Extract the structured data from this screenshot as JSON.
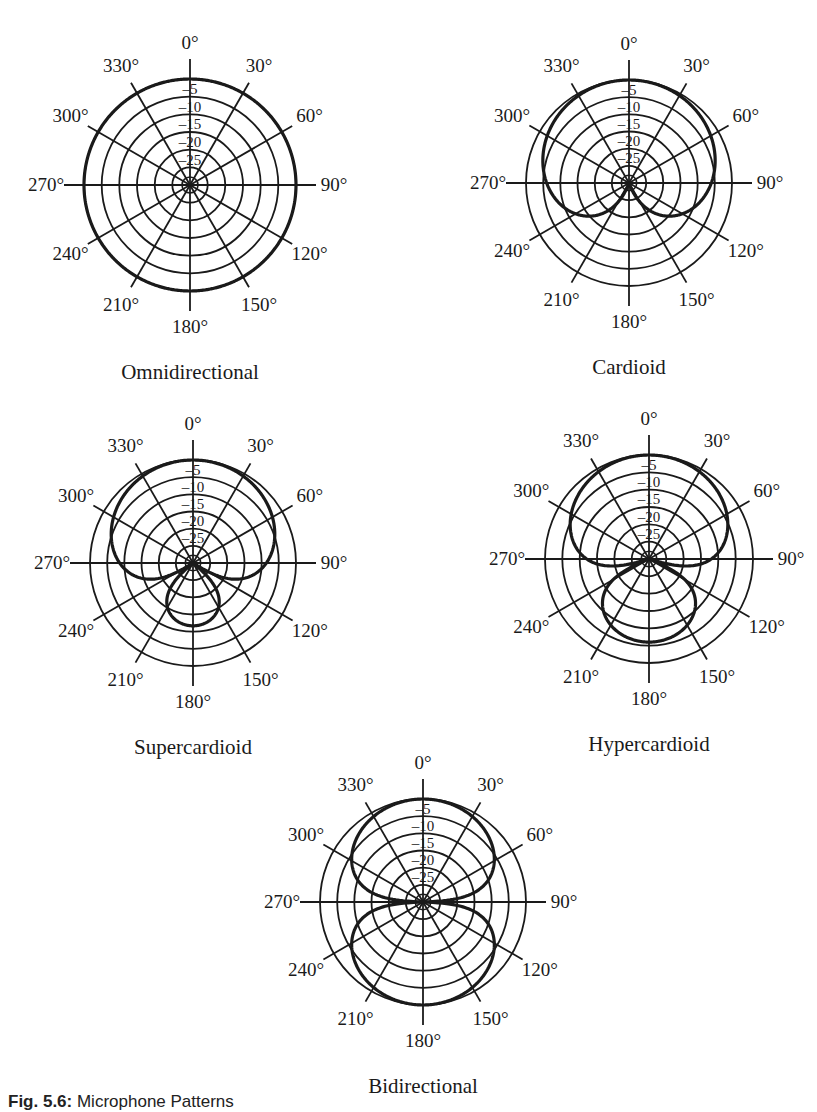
{
  "figure": {
    "caption_label": "Fig. 5.6:",
    "caption_text": " Microphone Patterns",
    "line_color": "#1a1a1a",
    "background": "#ffffff"
  },
  "chart_data": [
    {
      "type": "polar",
      "title": "Omnidirectional",
      "center": [
        190,
        185
      ],
      "radius": 106,
      "pattern_coefficient": 1.0,
      "theta_labels": [
        "0°",
        "30°",
        "60°",
        "90°",
        "120°",
        "150°",
        "180°",
        "210°",
        "240°",
        "270°",
        "300°",
        "330°"
      ],
      "ring_labels": [
        "–5",
        "–10",
        "–15",
        "–20",
        "–25"
      ],
      "r_range_db": [
        -30,
        0
      ],
      "angles_deg": [
        0,
        30,
        60,
        90,
        120,
        150,
        180,
        210,
        240,
        270,
        300,
        330
      ],
      "values_db": [
        0,
        0,
        0,
        0,
        0,
        0,
        0,
        0,
        0,
        0,
        0,
        0
      ]
    },
    {
      "type": "polar",
      "title": "Cardioid",
      "center": [
        629,
        183
      ],
      "radius": 103,
      "pattern_coefficient": 0.5,
      "theta_labels": [
        "0°",
        "30°",
        "60°",
        "90°",
        "120°",
        "150°",
        "180°",
        "210°",
        "240°",
        "270°",
        "300°",
        "330°"
      ],
      "ring_labels": [
        "–5",
        "–10",
        "–15",
        "–20",
        "–25"
      ],
      "r_range_db": [
        -30,
        0
      ],
      "angles_deg": [
        0,
        30,
        60,
        90,
        120,
        150,
        180,
        210,
        240,
        270,
        300,
        330
      ],
      "values_db": [
        0,
        -0.6,
        -2.5,
        -6,
        -12,
        -23,
        -30,
        -23,
        -12,
        -6,
        -2.5,
        -0.6
      ]
    },
    {
      "type": "polar",
      "title": "Supercardioid",
      "center": [
        193,
        563
      ],
      "radius": 103,
      "pattern_coefficient": 0.37,
      "theta_labels": [
        "0°",
        "30°",
        "60°",
        "90°",
        "120°",
        "150°",
        "180°",
        "210°",
        "240°",
        "270°",
        "300°",
        "330°"
      ],
      "ring_labels": [
        "–5",
        "–10",
        "–15",
        "–20",
        "–25"
      ],
      "r_range_db": [
        -30,
        0
      ],
      "angles_deg": [
        0,
        30,
        60,
        90,
        120,
        150,
        180,
        210,
        240,
        270,
        300,
        330
      ],
      "values_db": [
        0,
        -0.8,
        -3.6,
        -8.6,
        -30,
        -15,
        -11.7,
        -15,
        -30,
        -8.6,
        -3.6,
        -0.8
      ]
    },
    {
      "type": "polar",
      "title": "Hypercardioid",
      "center": [
        649,
        559
      ],
      "radius": 104,
      "pattern_coefficient": 0.25,
      "theta_labels": [
        "0°",
        "30°",
        "60°",
        "90°",
        "120°",
        "150°",
        "180°",
        "210°",
        "240°",
        "270°",
        "300°",
        "330°"
      ],
      "ring_labels": [
        "–5",
        "–10",
        "–15",
        "–20",
        "–25"
      ],
      "r_range_db": [
        -30,
        0
      ],
      "angles_deg": [
        0,
        30,
        60,
        90,
        120,
        150,
        180,
        210,
        240,
        270,
        300,
        330
      ],
      "values_db": [
        0,
        -1,
        -4.4,
        -12,
        -30,
        -9.7,
        -6,
        -9.7,
        -30,
        -12,
        -4.4,
        -1
      ]
    },
    {
      "type": "polar",
      "title": "Bidirectional",
      "center": [
        423,
        902
      ],
      "radius": 103,
      "pattern_coefficient": 0.0,
      "theta_labels": [
        "0°",
        "30°",
        "60°",
        "90°",
        "120°",
        "150°",
        "180°",
        "210°",
        "240°",
        "270°",
        "300°",
        "330°"
      ],
      "ring_labels": [
        "–5",
        "–10",
        "–15",
        "–20",
        "–25"
      ],
      "r_range_db": [
        -30,
        0
      ],
      "angles_deg": [
        0,
        30,
        60,
        90,
        120,
        150,
        180,
        210,
        240,
        270,
        300,
        330
      ],
      "values_db": [
        0,
        -1.2,
        -6,
        -30,
        -6,
        -1.2,
        0,
        -1.2,
        -6,
        -30,
        -6,
        -1.2
      ]
    }
  ]
}
